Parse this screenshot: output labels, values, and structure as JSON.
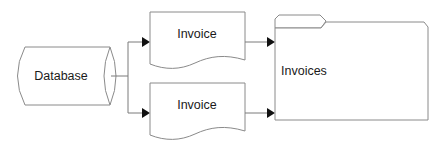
{
  "diagram": {
    "type": "flowchart",
    "nodes": [
      {
        "id": "db",
        "shape": "database-cylinder",
        "label": "Database"
      },
      {
        "id": "doc1",
        "shape": "document",
        "label": "Invoice"
      },
      {
        "id": "doc2",
        "shape": "document",
        "label": "Invoice"
      },
      {
        "id": "folder",
        "shape": "folder",
        "label": "Invoices"
      }
    ],
    "edges": [
      {
        "from": "db",
        "to": "doc1"
      },
      {
        "from": "db",
        "to": "doc2"
      },
      {
        "from": "doc1",
        "to": "folder"
      },
      {
        "from": "doc2",
        "to": "folder"
      }
    ]
  },
  "labels": {
    "database": "Database",
    "invoice_top": "Invoice",
    "invoice_bottom": "Invoice",
    "folder": "Invoices"
  }
}
